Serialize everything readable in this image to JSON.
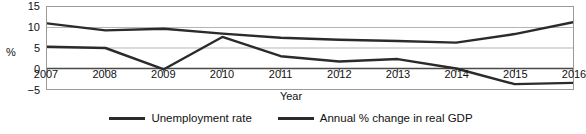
{
  "chart_data": {
    "type": "line",
    "title": "",
    "xlabel": "Year",
    "ylabel": "%",
    "categories": [
      "2007",
      "2008",
      "2009",
      "2010",
      "2011",
      "2012",
      "2013",
      "2014",
      "2015",
      "2016"
    ],
    "x": [
      2007,
      2008,
      2009,
      2010,
      2011,
      2012,
      2013,
      2014,
      2015,
      2016
    ],
    "ylim": [
      -5,
      15
    ],
    "yticks": [
      15,
      10,
      5,
      0,
      -5
    ],
    "ytick_labels": [
      "15",
      "10",
      "5",
      "0",
      "−5"
    ],
    "grid": true,
    "legend_position": "bottom",
    "series": [
      {
        "name": "Unemployment rate",
        "color": "#2b2b2b",
        "values": [
          11.0,
          9.3,
          9.7,
          8.5,
          7.5,
          7.0,
          6.7,
          6.3,
          8.4,
          11.3
        ]
      },
      {
        "name": "Annual % change in real GDP",
        "color": "#2b2b2b",
        "values": [
          5.3,
          5.0,
          -0.2,
          7.7,
          3.0,
          1.7,
          2.3,
          0.0,
          -3.8,
          -3.5
        ]
      }
    ]
  },
  "legend": {
    "items": [
      {
        "label": "Unemployment rate"
      },
      {
        "label": "Annual % change in real GDP"
      }
    ]
  },
  "axes": {
    "y_title": "%",
    "x_title": "Year"
  }
}
